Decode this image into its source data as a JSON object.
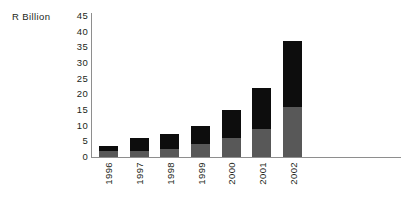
{
  "chart_data": {
    "type": "bar",
    "title": "",
    "subtitle": "",
    "xlabel": "",
    "ylabel": "R Billion",
    "ylim": [
      0,
      45
    ],
    "yticks": [
      0,
      5,
      10,
      15,
      20,
      25,
      30,
      35,
      40,
      45
    ],
    "ytick_labels": [
      "0",
      "5",
      "10",
      "15",
      "20",
      "25",
      "30",
      "35",
      "40",
      "45"
    ],
    "grid": false,
    "legend": false,
    "legend_position": "none",
    "stacked": true,
    "categories": [
      "1996",
      "1997",
      "1998",
      "1999",
      "2000",
      "2001",
      "2002"
    ],
    "series": [
      {
        "name": "lower-segment",
        "color": "#585858",
        "values": [
          2,
          2,
          2.5,
          4,
          6,
          9,
          16
        ]
      },
      {
        "name": "upper-segment",
        "color": "#0d0d0d",
        "values": [
          1.5,
          4,
          5,
          6,
          9,
          13,
          21
        ]
      }
    ],
    "totals": [
      3.5,
      6,
      7.5,
      10,
      15,
      22,
      37
    ],
    "annotations": []
  },
  "axis": {
    "y_title": "R Billion",
    "axis_color": "#8e8e8e",
    "text_color": "#231f20"
  },
  "colors": {
    "background": "#ffffff",
    "segment_upper": "#0d0d0d",
    "segment_lower": "#585858",
    "axis": "#8e8e8e",
    "text": "#231f20"
  }
}
